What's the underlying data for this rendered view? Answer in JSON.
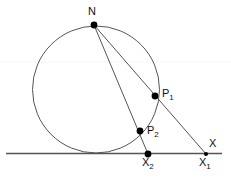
{
  "figure": {
    "type": "geometry-diagram",
    "width": 231,
    "height": 181,
    "background_color": "#ffffff",
    "stroke_color": "#555555",
    "point_color": "#000000",
    "label_color": "#111111"
  },
  "labels": {
    "n": "N",
    "p1_base": "P",
    "p1_sub": "1",
    "p2_base": "P",
    "p2_sub": "2",
    "x1_base": "X",
    "x1_sub": "1",
    "x2_base": "X",
    "x2_sub": "2",
    "line_x": "X"
  },
  "geometry": {
    "circle": {
      "cx": 96,
      "cy": 89.5,
      "r": 63.5
    },
    "horizontal_line": {
      "x1": 6,
      "y1": 153.5,
      "x2": 222,
      "y2": 153.5
    },
    "faint_line": {
      "x1": 0,
      "y1": 62,
      "x2": 231,
      "y2": 62
    },
    "points": {
      "N": {
        "x": 94,
        "y": 25
      },
      "P1": {
        "x": 155,
        "y": 96
      },
      "P2": {
        "x": 140,
        "y": 131
      },
      "X1": {
        "x": 206,
        "y": 154
      },
      "X2": {
        "x": 148,
        "y": 154
      }
    },
    "segments": [
      {
        "name": "N-to-X1",
        "from": "N",
        "to": "X1",
        "through": "P1"
      },
      {
        "name": "N-to-X2",
        "from": "N",
        "to": "X2",
        "through": "P2"
      }
    ]
  }
}
